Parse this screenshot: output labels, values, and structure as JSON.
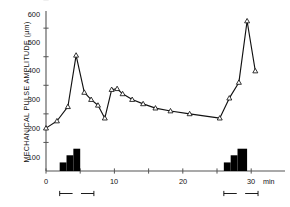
{
  "chart_data": {
    "type": "line",
    "title": "",
    "xlabel": "min",
    "ylabel": "MECHANICAL PULSE AMPLITUDE  (µm)",
    "xlim": [
      -0.9,
      34.5
    ],
    "ylim": [
      0,
      620
    ],
    "grid": false,
    "legend": null,
    "x_ticks": [
      0,
      5,
      10,
      15,
      20,
      25,
      30
    ],
    "x_tick_labels": [
      "0",
      "",
      "10",
      "",
      "20",
      "",
      "30"
    ],
    "y_ticks": [
      100,
      200,
      300,
      400,
      500,
      600
    ],
    "y_tick_labels": [
      "100",
      "200",
      "300",
      "400",
      "500",
      "600"
    ],
    "marker": "open-triangle",
    "series": [
      {
        "name": "mechanical pulse amplitude",
        "x": [
          0.0,
          1.6,
          3.2,
          4.4,
          5.6,
          6.6,
          7.6,
          8.6,
          9.6,
          10.4,
          11.2,
          12.6,
          14.2,
          16.0,
          18.2,
          21.0,
          25.4,
          26.8,
          28.2,
          29.4,
          30.6
        ],
        "values": [
          150,
          175,
          225,
          405,
          275,
          250,
          230,
          185,
          285,
          288,
          270,
          250,
          235,
          220,
          210,
          200,
          185,
          255,
          310,
          525,
          350
        ]
      }
    ],
    "stimulus_bars": [
      {
        "group": 1,
        "steps": [
          {
            "x_start": 2.0,
            "x_end": 3.0,
            "height": 30
          },
          {
            "x_start": 3.0,
            "x_end": 4.0,
            "height": 55
          },
          {
            "x_start": 4.0,
            "x_end": 5.0,
            "height": 78
          }
        ]
      },
      {
        "group": 2,
        "steps": [
          {
            "x_start": 26.0,
            "x_end": 27.0,
            "height": 30
          },
          {
            "x_start": 27.0,
            "x_end": 28.0,
            "height": 55
          },
          {
            "x_start": 28.0,
            "x_end": 29.4,
            "height": 78
          }
        ]
      }
    ],
    "span_markers": [
      {
        "label": "5",
        "x_start": 2.0,
        "x_end": 7.0
      },
      {
        "label": "5",
        "x_start": 26.0,
        "x_end": 31.0
      }
    ]
  },
  "colors": {
    "axis": "#555555",
    "line": "#111111",
    "marker_fill": "#ffffff",
    "bar_fill": "#000000",
    "text": "#111111",
    "background": "#ffffff"
  },
  "axis": {
    "y_label": "MECHANICAL PULSE AMPLITUDE  (µm)",
    "x_unit_label": "min"
  },
  "y_tick_labels": {
    "t600": "600",
    "t500": "500",
    "t400": "400",
    "t300": "300",
    "t200": "200",
    "t100": "100"
  },
  "x_tick_labels": {
    "t0": "0",
    "t10": "10",
    "t20": "20",
    "t30": "30"
  },
  "span_labels": {
    "left": "5",
    "right": "5"
  }
}
